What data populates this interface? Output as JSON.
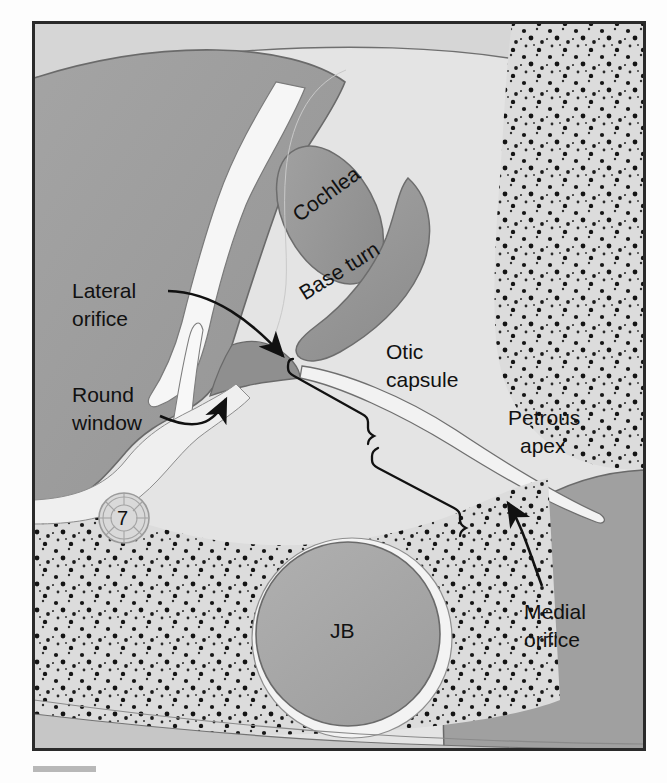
{
  "figure": {
    "frame": {
      "x": 33,
      "y": 22,
      "width": 612,
      "height": 728
    }
  },
  "labels": {
    "lateral_orifice": {
      "line1": "Lateral",
      "line2": "orifice"
    },
    "round_window": {
      "line1": "Round",
      "line2": "window"
    },
    "cochlea": "Cochlea",
    "base_turn": "Base turn",
    "otic_capsule": {
      "line1": "Otic",
      "line2": "capsule"
    },
    "petrous_apex": {
      "line1": "Petrous",
      "line2": "apex"
    },
    "medial_orifice": {
      "line1": "Medial",
      "line2": "orifice"
    },
    "jugular_bulb": "JB",
    "facial_nerve": "7"
  },
  "colors": {
    "frame_border": "#2a2a2a",
    "page_background": "#fdfdfd",
    "bone_dark": "#9e9e9e",
    "bone_mid": "#aaaaaa",
    "bone_light": "#d8d8d8",
    "otic_capsule_fill": "#e3e3e3",
    "cochlea_fill": "#9a9a9a",
    "air_white": "#f4f4f4",
    "stipple_field": "#dcdcdc",
    "stipple_dot": "#1a1a1a",
    "jugular_bulb_fill": "#a6a6a6",
    "outline": "#555555",
    "leader_line": "#111111",
    "text": "#111111",
    "scale_bar": "#b8b8b8"
  },
  "annotations": {
    "leader_type_lateral_orifice": "curved-arrow",
    "leader_type_round_window": "curved-arrow",
    "leader_type_medial_orifice": "curved-arrow",
    "leader_type_otic_capsule": "brace",
    "leader_type_petrous_apex": "brace"
  }
}
